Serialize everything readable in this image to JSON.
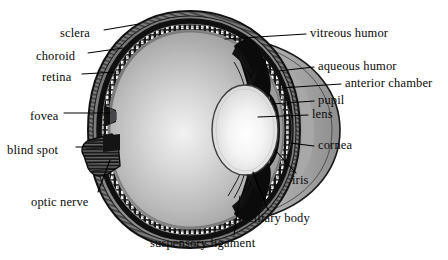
{
  "figure": {
    "background_color": "#ffffff",
    "text_color": "#0a0a0a",
    "leader_line_color": "#000000"
  },
  "palette": {
    "sclera_outer": "#2a2a2a",
    "sclera_band": "#8c8c8c",
    "choroid": "#1a1a1a",
    "retina_beads": "#f2f2f2",
    "vitreous_light": "#f0f0f0",
    "vitreous_mid": "#b8b8b8",
    "vitreous_dark": "#8f8f8f",
    "aqueous": "#a8a8a8",
    "lens_light": "#fbfbfb",
    "lens_edge": "#cfcfcf",
    "iris_dark": "#0d0d0d",
    "cornea": "#9a9a9a",
    "optic_nerve": "#232323"
  },
  "labels_left": [
    {
      "id": "sclera",
      "text": "sclera",
      "x": 60,
      "y": 33,
      "line": {
        "x1": 104,
        "y1": 30,
        "x2": 139,
        "y2": 24
      }
    },
    {
      "id": "choroid",
      "text": "choroid",
      "x": 36,
      "y": 56,
      "line": {
        "x1": 88,
        "y1": 53,
        "x2": 123,
        "y2": 48
      }
    },
    {
      "id": "retina",
      "text": "retina",
      "x": 42,
      "y": 77,
      "line": {
        "x1": 82,
        "y1": 74,
        "x2": 116,
        "y2": 72
      }
    },
    {
      "id": "fovea",
      "text": "fovea",
      "x": 30,
      "y": 116,
      "line": {
        "x1": 64,
        "y1": 113,
        "x2": 110,
        "y2": 113
      }
    },
    {
      "id": "blind-spot",
      "text": "blind spot",
      "x": 7,
      "y": 150,
      "line": {
        "x1": 76,
        "y1": 147,
        "x2": 102,
        "y2": 147
      }
    },
    {
      "id": "optic-nerve",
      "text": "optic nerve",
      "x": 31,
      "y": 202,
      "line": {
        "x1": 98,
        "y1": 192,
        "x2": 110,
        "y2": 160
      }
    }
  ],
  "labels_right": [
    {
      "id": "vitreous-humor",
      "text": "vitreous humor",
      "x": 310,
      "y": 33,
      "line": {
        "x1": 306,
        "y1": 34,
        "x2": 225,
        "y2": 39
      }
    },
    {
      "id": "aqueous-humor",
      "text": "aqueous humor",
      "x": 318,
      "y": 66,
      "line": {
        "x1": 314,
        "y1": 67,
        "x2": 278,
        "y2": 71
      }
    },
    {
      "id": "anterior-chamber",
      "text": "anterior chamber",
      "x": 345,
      "y": 83,
      "line": {
        "x1": 341,
        "y1": 84,
        "x2": 281,
        "y2": 88
      }
    },
    {
      "id": "pupil",
      "text": "pupil",
      "x": 318,
      "y": 100,
      "line": {
        "x1": 314,
        "y1": 101,
        "x2": 272,
        "y2": 104
      }
    },
    {
      "id": "lens",
      "text": "lens",
      "x": 312,
      "y": 114,
      "line": {
        "x1": 308,
        "y1": 115,
        "x2": 258,
        "y2": 117
      }
    },
    {
      "id": "cornea",
      "text": "cornea",
      "x": 318,
      "y": 145,
      "line": {
        "x1": 314,
        "y1": 146,
        "x2": 290,
        "y2": 143
      }
    },
    {
      "id": "iris",
      "text": "iris",
      "x": 292,
      "y": 180,
      "line": {
        "x1": 296,
        "y1": 173,
        "x2": 275,
        "y2": 150
      }
    },
    {
      "id": "ciliary-body",
      "text": "ciliary body",
      "x": 248,
      "y": 218,
      "line": {
        "x1": 268,
        "y1": 210,
        "x2": 253,
        "y2": 172
      }
    },
    {
      "id": "suspensory",
      "text": "suspensory ligament",
      "x": 150,
      "y": 243,
      "line": {
        "x1": 234,
        "y1": 235,
        "x2": 240,
        "y2": 196
      }
    }
  ]
}
